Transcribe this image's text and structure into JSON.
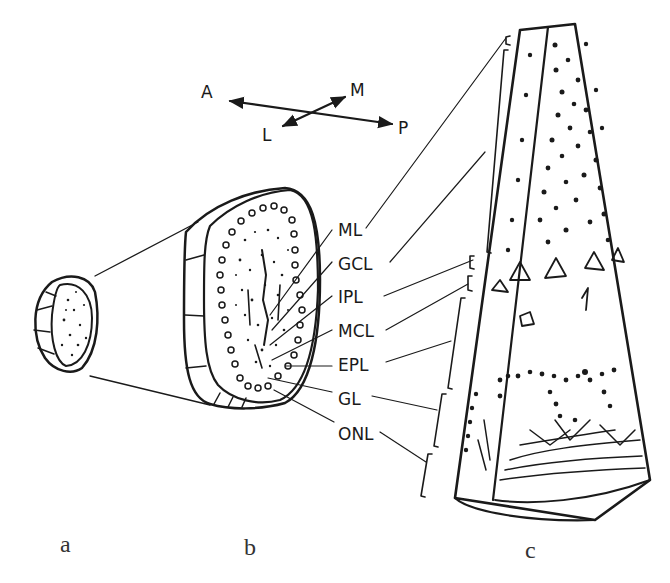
{
  "figure": {
    "type": "anatomical line drawing"
  },
  "orientation": {
    "axis1": {
      "from": "A",
      "to": "P"
    },
    "axis2": {
      "from": "L",
      "to": "M"
    }
  },
  "layer_labels": [
    {
      "abbr": "ML"
    },
    {
      "abbr": "GCL"
    },
    {
      "abbr": "IPL"
    },
    {
      "abbr": "MCL"
    },
    {
      "abbr": "EPL"
    },
    {
      "abbr": "GL"
    },
    {
      "abbr": "ONL"
    }
  ],
  "panels": [
    {
      "id": "a"
    },
    {
      "id": "b"
    },
    {
      "id": "c"
    }
  ],
  "colors": {
    "ink": "#1a1a1a",
    "background": "#ffffff"
  }
}
